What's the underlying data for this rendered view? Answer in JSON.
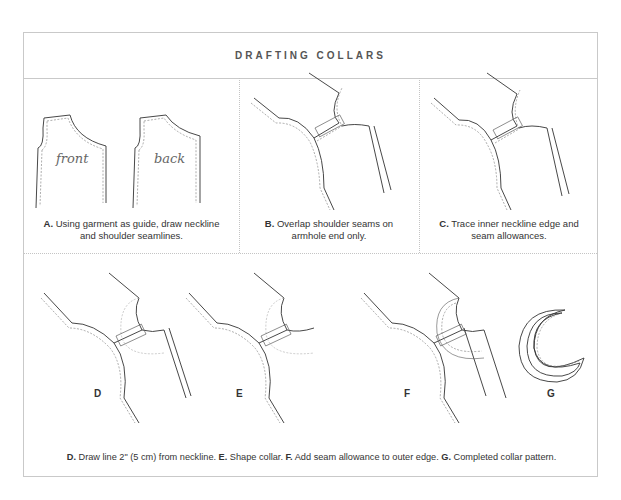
{
  "title": "DRAFTING COLLARS",
  "panels": {
    "a": {
      "label_front": "front",
      "label_back": "back",
      "caption_letter": "A.",
      "caption_line1": "Using garment as guide, draw neckline",
      "caption_line2": "and shoulder seamlines."
    },
    "b": {
      "caption_letter": "B.",
      "caption_line1": "Overlap shoulder seams on",
      "caption_line2": "armhole end only."
    },
    "c": {
      "caption_letter": "C.",
      "caption_line1": "Trace inner neckline edge and",
      "caption_line2": "seam allowances."
    },
    "d": {
      "letter": "D"
    },
    "e": {
      "letter": "E"
    },
    "f": {
      "letter": "F"
    },
    "g": {
      "letter": "G"
    }
  },
  "bottom_caption": {
    "d_letter": "D.",
    "d_text": " Draw line 2\" (5 cm) from neckline. ",
    "e_letter": "E.",
    "e_text": " Shape collar. ",
    "f_letter": "F.",
    "f_text": " Add seam allowance to outer edge. ",
    "g_letter": "G.",
    "g_text": " Completed collar pattern."
  }
}
